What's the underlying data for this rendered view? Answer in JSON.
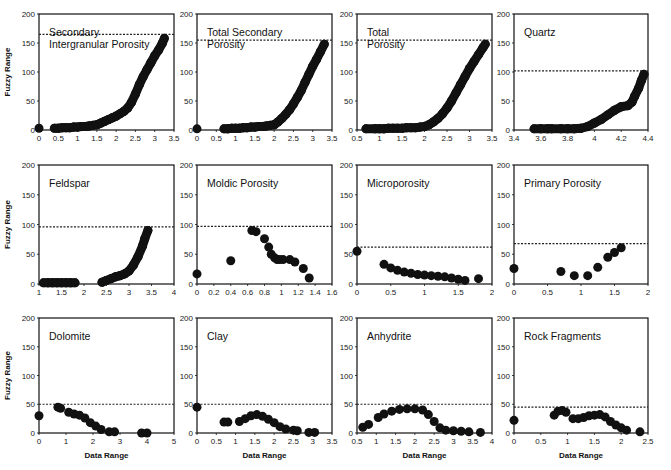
{
  "figure": {
    "colors": {
      "marker": "#111111",
      "frame": "#111111",
      "threshold": "#222222",
      "background": "#ffffff"
    },
    "shared_ylabel": "Fuzzy Range",
    "shared_xlabel": "Data Range"
  },
  "chart_data": [
    {
      "type": "scatter",
      "title": "Secondary Intergranular Porosity",
      "title_lines": [
        "Secondary",
        "Intergranular Porosity"
      ],
      "xlabel": "",
      "ylabel": "Fuzzy Range",
      "xlim": [
        0,
        3.5
      ],
      "ylim": [
        0,
        200
      ],
      "xticks": [
        "0",
        "0.5",
        "1",
        "1.5",
        "2",
        "2.5",
        "3",
        "3.5"
      ],
      "yticks": [
        "0",
        "50",
        "100",
        "150",
        "200"
      ],
      "threshold": 165,
      "points": [
        [
          0,
          3
        ],
        [
          0.4,
          3
        ],
        [
          0.5,
          3
        ],
        [
          0.6,
          4
        ],
        [
          0.7,
          4
        ],
        [
          0.8,
          4
        ],
        [
          0.9,
          5
        ],
        [
          1,
          5
        ],
        [
          1.1,
          6
        ],
        [
          1.2,
          6
        ],
        [
          1.3,
          7
        ],
        [
          1.4,
          8
        ],
        [
          1.5,
          9
        ],
        [
          1.6,
          12
        ],
        [
          1.7,
          15
        ],
        [
          1.8,
          18
        ],
        [
          1.9,
          21
        ],
        [
          2,
          24
        ],
        [
          2.1,
          28
        ],
        [
          2.2,
          32
        ],
        [
          2.3,
          38
        ],
        [
          2.4,
          48
        ],
        [
          2.5,
          62
        ],
        [
          2.6,
          78
        ],
        [
          2.7,
          92
        ],
        [
          2.8,
          104
        ],
        [
          2.9,
          116
        ],
        [
          3,
          128
        ],
        [
          3.1,
          138
        ],
        [
          3.2,
          150
        ],
        [
          3.25,
          158
        ]
      ],
      "grid": false
    },
    {
      "type": "scatter",
      "title": "Total Secondary Porosity",
      "title_lines": [
        "Total Secondary",
        "Porosity"
      ],
      "xlabel": "",
      "ylabel": "",
      "xlim": [
        0,
        3.5
      ],
      "ylim": [
        0,
        200
      ],
      "xticks": [
        "0",
        "0.5",
        "1",
        "1.5",
        "2",
        "2.5",
        "3",
        "3.5"
      ],
      "yticks": [
        "0",
        "50",
        "100",
        "150",
        "200"
      ],
      "threshold": 155,
      "points": [
        [
          0,
          2
        ],
        [
          0.7,
          2
        ],
        [
          0.8,
          2
        ],
        [
          0.9,
          3
        ],
        [
          1,
          3
        ],
        [
          1.1,
          3
        ],
        [
          1.2,
          4
        ],
        [
          1.3,
          4
        ],
        [
          1.4,
          5
        ],
        [
          1.5,
          5
        ],
        [
          1.6,
          6
        ],
        [
          1.7,
          6
        ],
        [
          1.8,
          7
        ],
        [
          1.9,
          8
        ],
        [
          2,
          9
        ],
        [
          2.1,
          14
        ],
        [
          2.2,
          20
        ],
        [
          2.3,
          27
        ],
        [
          2.4,
          35
        ],
        [
          2.5,
          45
        ],
        [
          2.6,
          56
        ],
        [
          2.7,
          68
        ],
        [
          2.8,
          82
        ],
        [
          2.9,
          96
        ],
        [
          3,
          110
        ],
        [
          3.1,
          122
        ],
        [
          3.2,
          135
        ],
        [
          3.3,
          148
        ]
      ],
      "grid": false
    },
    {
      "type": "scatter",
      "title": "Total Porosity",
      "title_lines": [
        "Total",
        "Porosity"
      ],
      "xlabel": "",
      "ylabel": "",
      "xlim": [
        0.5,
        3.5
      ],
      "ylim": [
        0,
        200
      ],
      "xticks": [
        "0.5",
        "1",
        "1.5",
        "2",
        "2.5",
        "3",
        "3.5"
      ],
      "yticks": [
        "0",
        "50",
        "100",
        "150",
        "200"
      ],
      "threshold": 155,
      "points": [
        [
          0.7,
          2
        ],
        [
          0.9,
          2
        ],
        [
          1,
          2
        ],
        [
          1.1,
          2
        ],
        [
          1.2,
          3
        ],
        [
          1.3,
          3
        ],
        [
          1.4,
          3
        ],
        [
          1.5,
          3
        ],
        [
          1.6,
          4
        ],
        [
          1.7,
          4
        ],
        [
          1.8,
          4
        ],
        [
          1.9,
          5
        ],
        [
          2,
          6
        ],
        [
          2.1,
          9
        ],
        [
          2.2,
          14
        ],
        [
          2.3,
          20
        ],
        [
          2.4,
          28
        ],
        [
          2.5,
          38
        ],
        [
          2.6,
          50
        ],
        [
          2.7,
          64
        ],
        [
          2.8,
          78
        ],
        [
          2.9,
          92
        ],
        [
          3,
          106
        ],
        [
          3.1,
          118
        ],
        [
          3.2,
          130
        ],
        [
          3.3,
          142
        ],
        [
          3.35,
          148
        ]
      ],
      "grid": false
    },
    {
      "type": "scatter",
      "title": "Quartz",
      "title_lines": [
        "Quartz"
      ],
      "xlabel": "",
      "ylabel": "",
      "xlim": [
        3.4,
        4.4
      ],
      "ylim": [
        0,
        200
      ],
      "xticks": [
        "3.4",
        "3.6",
        "3.8",
        "4",
        "4.2",
        "4.4"
      ],
      "yticks": [
        "0",
        "50",
        "100",
        "150",
        "200"
      ],
      "threshold": 102,
      "points": [
        [
          3.55,
          2
        ],
        [
          3.6,
          2
        ],
        [
          3.65,
          2
        ],
        [
          3.68,
          2
        ],
        [
          3.75,
          2
        ],
        [
          3.8,
          2
        ],
        [
          3.85,
          2
        ],
        [
          3.9,
          3
        ],
        [
          3.95,
          6
        ],
        [
          4,
          12
        ],
        [
          4.05,
          18
        ],
        [
          4.1,
          26
        ],
        [
          4.15,
          34
        ],
        [
          4.2,
          40
        ],
        [
          4.25,
          42
        ],
        [
          4.28,
          48
        ],
        [
          4.3,
          58
        ],
        [
          4.33,
          72
        ],
        [
          4.35,
          85
        ],
        [
          4.37,
          96
        ]
      ],
      "grid": false
    },
    {
      "type": "scatter",
      "title": "Feldspar",
      "title_lines": [
        "Feldspar"
      ],
      "xlabel": "",
      "ylabel": "Fuzzy Range",
      "xlim": [
        1,
        4
      ],
      "ylim": [
        0,
        200
      ],
      "xticks": [
        "1",
        "1.5",
        "2",
        "2.5",
        "3",
        "3.5",
        "4"
      ],
      "yticks": [
        "0",
        "50",
        "100",
        "150",
        "200"
      ],
      "threshold": 96,
      "points": [
        [
          1.1,
          2
        ],
        [
          1.2,
          2
        ],
        [
          1.3,
          2
        ],
        [
          1.4,
          2
        ],
        [
          1.5,
          2
        ],
        [
          1.6,
          2
        ],
        [
          1.7,
          2
        ],
        [
          1.8,
          2
        ],
        [
          2.4,
          3
        ],
        [
          2.5,
          6
        ],
        [
          2.6,
          9
        ],
        [
          2.7,
          12
        ],
        [
          2.8,
          14
        ],
        [
          2.9,
          17
        ],
        [
          3,
          22
        ],
        [
          3.1,
          32
        ],
        [
          3.2,
          46
        ],
        [
          3.3,
          64
        ],
        [
          3.35,
          76
        ],
        [
          3.42,
          90
        ]
      ],
      "grid": false
    },
    {
      "type": "scatter",
      "title": "Moldic Porosity",
      "title_lines": [
        "Moldic Porosity"
      ],
      "xlabel": "",
      "ylabel": "",
      "xlim": [
        0,
        1.6
      ],
      "ylim": [
        0,
        200
      ],
      "xticks": [
        "0",
        "0.2",
        "0.4",
        "0.6",
        "0.8",
        "1",
        "1.2",
        "1.4",
        "1.6"
      ],
      "yticks": [
        "0",
        "50",
        "100",
        "150",
        "200"
      ],
      "threshold": 97,
      "points": [
        [
          0,
          17
        ],
        [
          0.4,
          39
        ],
        [
          0.65,
          90
        ],
        [
          0.7,
          88
        ],
        [
          0.8,
          76
        ],
        [
          0.85,
          62
        ],
        [
          0.88,
          50
        ],
        [
          0.92,
          44
        ],
        [
          0.95,
          41
        ],
        [
          0.98,
          41
        ],
        [
          1.02,
          41
        ],
        [
          1.1,
          41
        ],
        [
          1.16,
          37
        ],
        [
          1.26,
          26
        ],
        [
          1.33,
          10
        ]
      ],
      "grid": false
    },
    {
      "type": "scatter",
      "title": "Microporosity",
      "title_lines": [
        "Microporosity"
      ],
      "xlabel": "",
      "ylabel": "",
      "xlim": [
        0,
        2
      ],
      "ylim": [
        0,
        200
      ],
      "xticks": [
        "0",
        "0.5",
        "1",
        "1.5",
        "2"
      ],
      "yticks": [
        "0",
        "50",
        "100",
        "150",
        "200"
      ],
      "threshold": 62,
      "points": [
        [
          0,
          55
        ],
        [
          0.4,
          33
        ],
        [
          0.5,
          27
        ],
        [
          0.6,
          23
        ],
        [
          0.7,
          20
        ],
        [
          0.8,
          18
        ],
        [
          0.9,
          16
        ],
        [
          1,
          15
        ],
        [
          1.1,
          14
        ],
        [
          1.2,
          13
        ],
        [
          1.3,
          12
        ],
        [
          1.4,
          10
        ],
        [
          1.5,
          8
        ],
        [
          1.6,
          6
        ],
        [
          1.8,
          9
        ]
      ],
      "grid": false
    },
    {
      "type": "scatter",
      "title": "Primary Porosity",
      "title_lines": [
        "Primary Porosity"
      ],
      "xlabel": "",
      "ylabel": "",
      "xlim": [
        0,
        2
      ],
      "ylim": [
        0,
        200
      ],
      "xticks": [
        "0",
        "0.5",
        "1",
        "1.5",
        "2"
      ],
      "yticks": [
        "0",
        "50",
        "100",
        "150",
        "200"
      ],
      "threshold": 68,
      "points": [
        [
          0,
          26
        ],
        [
          0.7,
          21
        ],
        [
          0.9,
          14
        ],
        [
          1.1,
          14
        ],
        [
          1.25,
          28
        ],
        [
          1.4,
          45
        ],
        [
          1.5,
          53
        ],
        [
          1.6,
          61
        ]
      ],
      "grid": false
    },
    {
      "type": "scatter",
      "title": "Dolomite",
      "title_lines": [
        "Dolomite"
      ],
      "xlabel": "Data Range",
      "ylabel": "Fuzzy Range",
      "xlim": [
        0,
        5
      ],
      "ylim": [
        0,
        200
      ],
      "xticks": [
        "0",
        "1",
        "2",
        "3",
        "4",
        "5"
      ],
      "yticks": [
        "0",
        "50",
        "100",
        "150",
        "200"
      ],
      "threshold": 50,
      "points": [
        [
          0,
          30
        ],
        [
          0.7,
          45
        ],
        [
          0.8,
          43
        ],
        [
          1.1,
          36
        ],
        [
          1.3,
          33
        ],
        [
          1.5,
          31
        ],
        [
          1.7,
          26
        ],
        [
          1.9,
          18
        ],
        [
          2.1,
          12
        ],
        [
          2.3,
          6
        ],
        [
          2.6,
          2
        ],
        [
          2.8,
          2
        ],
        [
          3.8,
          0
        ],
        [
          4,
          0
        ]
      ],
      "grid": false
    },
    {
      "type": "scatter",
      "title": "Clay",
      "title_lines": [
        "Clay"
      ],
      "xlabel": "Data Range",
      "ylabel": "",
      "xlim": [
        0,
        3.5
      ],
      "ylim": [
        0,
        200
      ],
      "xticks": [
        "0",
        "0.5",
        "1",
        "1.5",
        "2",
        "2.5",
        "3",
        "3.5"
      ],
      "yticks": [
        "0",
        "50",
        "100",
        "150",
        "200"
      ],
      "threshold": 50,
      "points": [
        [
          0,
          45
        ],
        [
          0.7,
          19
        ],
        [
          0.8,
          19
        ],
        [
          1.1,
          20
        ],
        [
          1.25,
          25
        ],
        [
          1.4,
          30
        ],
        [
          1.55,
          32
        ],
        [
          1.7,
          29
        ],
        [
          1.85,
          24
        ],
        [
          2,
          18
        ],
        [
          2.15,
          11
        ],
        [
          2.3,
          7
        ],
        [
          2.5,
          5
        ],
        [
          2.6,
          4
        ],
        [
          2.9,
          1
        ],
        [
          3.05,
          1
        ]
      ],
      "grid": false
    },
    {
      "type": "scatter",
      "title": "Anhydrite",
      "title_lines": [
        "Anhydrite"
      ],
      "xlabel": "Data Range",
      "ylabel": "",
      "xlim": [
        0.5,
        4
      ],
      "ylim": [
        0,
        200
      ],
      "xticks": [
        "0.5",
        "1",
        "1.5",
        "2",
        "2.5",
        "3",
        "3.5",
        "4"
      ],
      "yticks": [
        "0",
        "50",
        "100",
        "150",
        "200"
      ],
      "threshold": 50,
      "points": [
        [
          0.65,
          10
        ],
        [
          0.8,
          15
        ],
        [
          1.05,
          27
        ],
        [
          1.2,
          33
        ],
        [
          1.4,
          38
        ],
        [
          1.6,
          41
        ],
        [
          1.8,
          42
        ],
        [
          2,
          42
        ],
        [
          2.2,
          40
        ],
        [
          2.35,
          32
        ],
        [
          2.5,
          20
        ],
        [
          2.65,
          9
        ],
        [
          2.8,
          5
        ],
        [
          3,
          4
        ],
        [
          3.2,
          3
        ],
        [
          3.4,
          2
        ],
        [
          3.7,
          1
        ]
      ],
      "grid": false
    },
    {
      "type": "scatter",
      "title": "Rock Fragments",
      "title_lines": [
        "Rock Fragments"
      ],
      "xlabel": "Data Range",
      "ylabel": "",
      "xlim": [
        0,
        2.5
      ],
      "ylim": [
        0,
        200
      ],
      "xticks": [
        "0",
        "0.5",
        "1",
        "1.5",
        "2",
        "2.5"
      ],
      "yticks": [
        "0",
        "50",
        "100",
        "150",
        "200"
      ],
      "threshold": 45,
      "points": [
        [
          0,
          22
        ],
        [
          0.75,
          31
        ],
        [
          0.82,
          38
        ],
        [
          0.9,
          39
        ],
        [
          0.97,
          36
        ],
        [
          1.1,
          25
        ],
        [
          1.2,
          25
        ],
        [
          1.3,
          27
        ],
        [
          1.4,
          30
        ],
        [
          1.5,
          31
        ],
        [
          1.6,
          32
        ],
        [
          1.7,
          28
        ],
        [
          1.8,
          20
        ],
        [
          1.9,
          14
        ],
        [
          2,
          9
        ],
        [
          2.1,
          5
        ],
        [
          2.35,
          2
        ]
      ],
      "grid": false
    }
  ]
}
